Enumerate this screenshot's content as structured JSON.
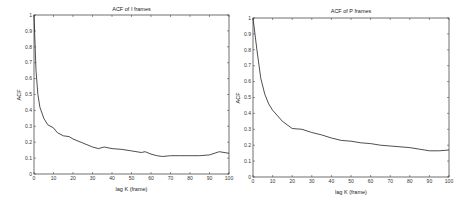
{
  "chart_data": [
    {
      "type": "line",
      "title": "ACF of I frames",
      "xlabel": "lag K (frame)",
      "ylabel": "ACF",
      "xlim": [
        0,
        100
      ],
      "ylim": [
        0,
        1
      ],
      "xticks": [
        0,
        10,
        20,
        30,
        40,
        50,
        60,
        70,
        80,
        90,
        100
      ],
      "yticks": [
        0,
        0.1,
        0.2,
        0.3,
        0.4,
        0.5,
        0.6,
        0.7,
        0.8,
        0.9,
        1
      ],
      "grid": false,
      "x": [
        0,
        1,
        2,
        3,
        5,
        7,
        10,
        12,
        15,
        18,
        20,
        25,
        30,
        33,
        36,
        40,
        45,
        50,
        55,
        57,
        60,
        63,
        66,
        70,
        75,
        80,
        85,
        90,
        95,
        100
      ],
      "values": [
        1.0,
        0.65,
        0.5,
        0.42,
        0.35,
        0.31,
        0.29,
        0.26,
        0.24,
        0.235,
        0.22,
        0.195,
        0.17,
        0.16,
        0.17,
        0.16,
        0.155,
        0.145,
        0.135,
        0.14,
        0.125,
        0.115,
        0.11,
        0.115,
        0.115,
        0.115,
        0.115,
        0.12,
        0.14,
        0.13
      ]
    },
    {
      "type": "line",
      "title": "ACF of P frames",
      "xlabel": "lag K (frame)",
      "ylabel": "ACF",
      "xlim": [
        0,
        100
      ],
      "ylim": [
        0,
        1
      ],
      "xticks": [
        0,
        10,
        20,
        30,
        40,
        50,
        60,
        70,
        80,
        90,
        100
      ],
      "yticks": [
        0,
        0.1,
        0.2,
        0.3,
        0.4,
        0.5,
        0.6,
        0.7,
        0.8,
        0.9,
        1
      ],
      "grid": false,
      "x": [
        0,
        2,
        4,
        6,
        8,
        10,
        15,
        20,
        25,
        30,
        35,
        40,
        45,
        50,
        55,
        60,
        65,
        70,
        75,
        80,
        85,
        90,
        95,
        100
      ],
      "values": [
        1.0,
        0.8,
        0.62,
        0.52,
        0.46,
        0.42,
        0.35,
        0.305,
        0.3,
        0.28,
        0.265,
        0.245,
        0.23,
        0.225,
        0.215,
        0.21,
        0.2,
        0.195,
        0.19,
        0.185,
        0.175,
        0.165,
        0.165,
        0.17
      ]
    }
  ],
  "charts": [
    {
      "title": "ACF of I frames",
      "xlabel": "lag K (frame)",
      "ylabel": "ACF"
    },
    {
      "title": "ACF of P frames",
      "xlabel": "lag K (frame)",
      "ylabel": "ACF"
    }
  ],
  "colors": {
    "line": "#222222",
    "axes": "#333333",
    "background": "#ffffff"
  }
}
